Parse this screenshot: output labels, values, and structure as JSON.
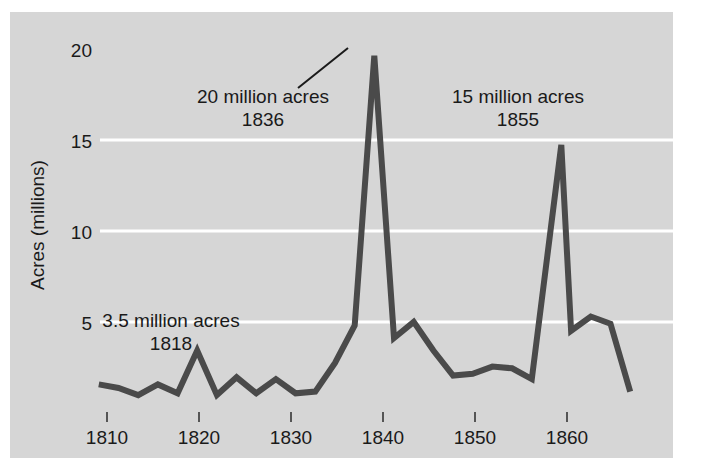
{
  "figure": {
    "background_color": "#ffffff",
    "panel_color": "#d6d6d6",
    "gridline_color": "#ffffff",
    "line_color": "#4a4a4a",
    "text_color": "#1a1a1a"
  },
  "chart_data": {
    "type": "line",
    "title": "",
    "subtitle": "",
    "xlabel": "",
    "ylabel": "Acres (millions)",
    "xlim": [
      1807,
      1863
    ],
    "ylim": [
      0,
      20.6
    ],
    "xticks": [
      1810,
      1820,
      1830,
      1840,
      1850,
      1860
    ],
    "xtick_labels": [
      "1810",
      "1820",
      "1830",
      "1840",
      "1850",
      "1860"
    ],
    "yticks": [
      5,
      10,
      15,
      20
    ],
    "ytick_labels": [
      "5",
      "10",
      "15",
      "20"
    ],
    "grid": "horizontal gridlines at 5, 10, 15 in white",
    "legend": "none",
    "series": [
      {
        "name": "Public land sales",
        "x": [
          1808,
          1810,
          1812,
          1814,
          1816,
          1818,
          1820,
          1822,
          1824,
          1826,
          1828,
          1830,
          1832,
          1834,
          1836,
          1838,
          1840,
          1842,
          1844,
          1846,
          1848,
          1850,
          1852,
          1855,
          1856,
          1858,
          1860,
          1862
        ],
        "values": [
          1.6,
          1.4,
          1.0,
          1.6,
          1.1,
          3.5,
          1.0,
          2.0,
          1.1,
          1.9,
          1.1,
          1.2,
          2.8,
          4.9,
          20.0,
          4.2,
          5.1,
          3.5,
          2.1,
          2.2,
          2.6,
          2.5,
          1.9,
          15.0,
          4.6,
          5.4,
          5.0,
          1.2
        ]
      }
    ],
    "annotations": [
      {
        "id": "annotation-1818",
        "line1": "3.5 million acres",
        "line2": "1818",
        "x": 1818,
        "y": 3.5
      },
      {
        "id": "annotation-1836",
        "line1": "20 million acres",
        "line2": "1836",
        "x": 1836,
        "y": 20.0,
        "has_leader_line": true
      },
      {
        "id": "annotation-1855",
        "line1": "15 million acres",
        "line2": "1855",
        "x": 1855,
        "y": 15.0
      }
    ]
  }
}
